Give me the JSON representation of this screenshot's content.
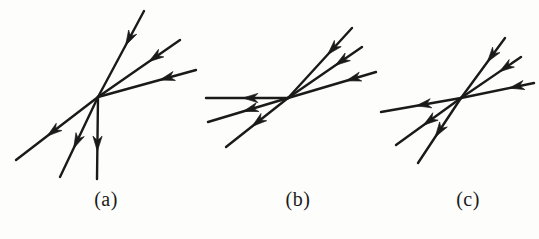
{
  "figure": {
    "type": "line-diagram",
    "background_color": "#fdfdfb",
    "stroke_color": "#1a1a1a",
    "width": 539,
    "height": 239
  },
  "captions": [
    {
      "id": "a",
      "label": "(a)"
    },
    {
      "id": "b",
      "label": "(b)"
    },
    {
      "id": "c",
      "label": "(c)"
    }
  ],
  "panels": [
    {
      "id": "a",
      "caption": "(a)",
      "vertex": {
        "x": 98,
        "y": 97
      },
      "rays": [
        {
          "name": "upper-steep-ray",
          "end": {
            "x": 144,
            "y": 11
          },
          "direction": "inward",
          "arrow_at": 0.6,
          "width": 2.4
        },
        {
          "name": "upper-middle-ray",
          "end": {
            "x": 180,
            "y": 40
          },
          "direction": "inward",
          "arrow_at": 0.62,
          "width": 2.4
        },
        {
          "name": "upper-shallow-ray",
          "end": {
            "x": 196,
            "y": 70
          },
          "direction": "inward",
          "arrow_at": 0.63,
          "width": 2.4
        },
        {
          "name": "lower-left-ray",
          "end": {
            "x": 16,
            "y": 160
          },
          "direction": "outward",
          "arrow_at": 0.62,
          "width": 2.4
        },
        {
          "name": "lower-middle-ray",
          "end": {
            "x": 60,
            "y": 177
          },
          "direction": "outward",
          "arrow_at": 0.64,
          "width": 2.4
        },
        {
          "name": "lower-vertical-ray",
          "end": {
            "x": 97,
            "y": 179
          },
          "direction": "outward",
          "arrow_at": 0.66,
          "width": 2.4
        }
      ]
    },
    {
      "id": "b",
      "caption": "(b)",
      "vertex": {
        "x": 288,
        "y": 98
      },
      "rays": [
        {
          "name": "upper-steep-ray",
          "end": {
            "x": 352,
            "y": 28
          },
          "direction": "inward",
          "arrow_at": 0.62,
          "width": 2.4
        },
        {
          "name": "upper-middle-ray",
          "end": {
            "x": 362,
            "y": 47
          },
          "direction": "inward",
          "arrow_at": 0.64,
          "width": 2.4
        },
        {
          "name": "upper-shallow-ray",
          "end": {
            "x": 376,
            "y": 72
          },
          "direction": "inward",
          "arrow_at": 0.66,
          "width": 2.4
        },
        {
          "name": "left-horizontal-ray",
          "end": {
            "x": 206,
            "y": 98
          },
          "direction": "outward",
          "arrow_at": 0.55,
          "width": 2.4
        },
        {
          "name": "left-middle-ray",
          "end": {
            "x": 208,
            "y": 122
          },
          "direction": "outward",
          "arrow_at": 0.56,
          "width": 2.4
        },
        {
          "name": "left-lower-ray",
          "end": {
            "x": 226,
            "y": 147
          },
          "direction": "outward",
          "arrow_at": 0.58,
          "width": 2.4
        }
      ]
    },
    {
      "id": "c",
      "caption": "(c)",
      "vertex": {
        "x": 461,
        "y": 98
      },
      "rays": [
        {
          "name": "upper-steep-ray",
          "end": {
            "x": 505,
            "y": 38
          },
          "direction": "inward",
          "arrow_at": 0.6,
          "width": 2.4
        },
        {
          "name": "upper-middle-ray",
          "end": {
            "x": 521,
            "y": 57
          },
          "direction": "inward",
          "arrow_at": 0.64,
          "width": 2.4
        },
        {
          "name": "upper-shallow-ray",
          "end": {
            "x": 534,
            "y": 83
          },
          "direction": "inward",
          "arrow_at": 0.66,
          "width": 2.4
        },
        {
          "name": "left-horizontal-ray",
          "end": {
            "x": 381,
            "y": 112
          },
          "direction": "outward",
          "arrow_at": 0.56,
          "width": 2.4
        },
        {
          "name": "left-middle-ray",
          "end": {
            "x": 396,
            "y": 145
          },
          "direction": "outward",
          "arrow_at": 0.58,
          "width": 2.4
        },
        {
          "name": "left-lower-ray",
          "end": {
            "x": 418,
            "y": 163
          },
          "direction": "outward",
          "arrow_at": 0.6,
          "width": 2.4
        }
      ]
    }
  ]
}
